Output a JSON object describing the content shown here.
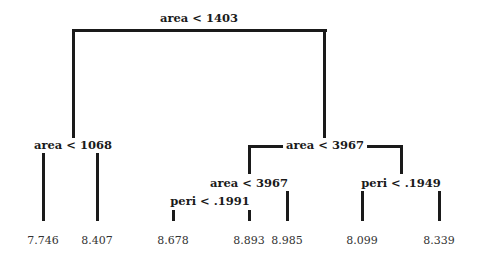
{
  "tree": {
    "root": {
      "label": "area < 1403"
    },
    "left": {
      "label": "area < 1068"
    },
    "right": {
      "label": "area < 3967"
    },
    "right_left": {
      "label": "area < 3967"
    },
    "right_left_left": {
      "label": "peri < .1991"
    },
    "right_right": {
      "label": "peri < .1949"
    },
    "leaves": [
      "7.746",
      "8.407",
      "8.678",
      "8.893",
      "8.985",
      "8.099",
      "8.339"
    ]
  }
}
